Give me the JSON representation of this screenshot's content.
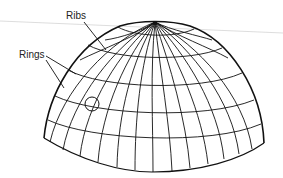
{
  "diagram": {
    "labels": [
      {
        "id": "ribs",
        "text": "Ribs",
        "x": 66,
        "y": 19
      },
      {
        "id": "rings",
        "text": "Rings",
        "x": 19,
        "y": 58
      }
    ],
    "colors": {
      "line": "#111111",
      "text": "#222222",
      "background": "#ffffff",
      "guide_line": "#c8c8c8"
    },
    "dome": {
      "apex": [
        155,
        22
      ],
      "left_base": [
        44,
        138
      ],
      "right_base": [
        264,
        143
      ],
      "bottom": [
        152,
        172
      ],
      "rib_count": 24,
      "ring_count": 5
    },
    "marker": {
      "shape": "circle",
      "cx": 92,
      "cy": 104,
      "r": 7
    }
  }
}
